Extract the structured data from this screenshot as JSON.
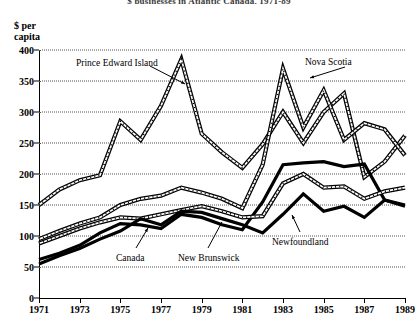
{
  "chart_data": {
    "type": "line",
    "title": "$ businesses in Atlantic Canada, 1971-89",
    "ylabel_line1": "$ per",
    "ylabel_line2": "capita",
    "xlabel": "",
    "ylim": [
      0,
      400
    ],
    "ytick_step": 50,
    "yticks": [
      "400",
      "350",
      "300",
      "250",
      "200",
      "150",
      "100",
      "50",
      "0"
    ],
    "ytick_values": [
      400,
      350,
      300,
      250,
      200,
      150,
      100,
      50,
      0
    ],
    "xlim": [
      1971,
      1989
    ],
    "xticks": [
      "1971",
      "1973",
      "1975",
      "1977",
      "1979",
      "1981",
      "1983",
      "1985",
      "1987",
      "1989"
    ],
    "xtick_values": [
      1971,
      1973,
      1975,
      1977,
      1979,
      1981,
      1983,
      1985,
      1987,
      1989
    ],
    "x": [
      1971,
      1972,
      1973,
      1974,
      1975,
      1976,
      1977,
      1978,
      1979,
      1980,
      1981,
      1982,
      1983,
      1984,
      1985,
      1986,
      1987,
      1988,
      1989
    ],
    "grid": "horizontal-dotted",
    "legend": "inline-annotations",
    "series": [
      {
        "name": "Prince Edward Island",
        "style": "double-line",
        "values": [
          150,
          175,
          190,
          198,
          285,
          255,
          310,
          385,
          265,
          235,
          210,
          248,
          300,
          250,
          300,
          330,
          195,
          220,
          262
        ]
      },
      {
        "name": "Nova Scotia",
        "style": "double-line",
        "values": [
          95,
          108,
          120,
          130,
          150,
          160,
          165,
          178,
          170,
          160,
          145,
          215,
          370,
          275,
          335,
          255,
          282,
          272,
          230
        ]
      },
      {
        "name": "Newfoundland",
        "style": "bold-line",
        "values": [
          62,
          72,
          85,
          105,
          120,
          118,
          112,
          135,
          130,
          118,
          110,
          155,
          215,
          218,
          220,
          212,
          216,
          158,
          150
        ]
      },
      {
        "name": "New Brunswick",
        "style": "double-line",
        "values": [
          88,
          100,
          112,
          122,
          130,
          128,
          135,
          142,
          148,
          140,
          130,
          132,
          185,
          200,
          178,
          180,
          160,
          172,
          178
        ]
      },
      {
        "name": "Canada",
        "style": "bold-line",
        "values": [
          55,
          68,
          80,
          95,
          108,
          128,
          118,
          140,
          138,
          128,
          118,
          105,
          135,
          168,
          140,
          148,
          130,
          158,
          148
        ]
      }
    ],
    "annotations": [
      {
        "label": "Prince Edward Island",
        "x_px": 76,
        "y_px": 58
      },
      {
        "label": "Nova Scotia",
        "x_px": 305,
        "y_px": 57
      },
      {
        "label": "Newfoundland",
        "x_px": 272,
        "y_px": 237
      },
      {
        "label": "New Brunswick",
        "x_px": 178,
        "y_px": 253
      },
      {
        "label": "Canada",
        "x_px": 116,
        "y_px": 253
      }
    ]
  },
  "colors": {
    "line": "#000000",
    "grid": "#555555",
    "background": "#ffffff"
  }
}
